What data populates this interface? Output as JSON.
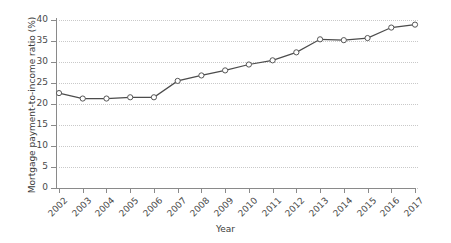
{
  "chart_data": {
    "type": "line",
    "title": "",
    "xlabel": "Year",
    "ylabel": "Mortgage payment-to-income ratio (%)",
    "categories": [
      "2002",
      "2003",
      "2004",
      "2005",
      "2006",
      "2007",
      "2008",
      "2009",
      "2010",
      "2011",
      "2012",
      "2013",
      "2014",
      "2015",
      "2016",
      "2017"
    ],
    "x": [
      2002,
      2003,
      2004,
      2005,
      2006,
      2007,
      2008,
      2009,
      2010,
      2011,
      2012,
      2013,
      2014,
      2015,
      2016,
      2017
    ],
    "values": [
      22.6,
      21.3,
      21.3,
      21.6,
      21.6,
      25.5,
      26.8,
      28.0,
      29.4,
      30.4,
      32.3,
      35.4,
      35.2,
      35.7,
      38.2,
      38.9
    ],
    "series": [
      {
        "name": "Mortgage payment-to-income ratio",
        "values": [
          22.6,
          21.3,
          21.3,
          21.6,
          21.6,
          25.5,
          26.8,
          28.0,
          29.4,
          30.4,
          32.3,
          35.4,
          35.2,
          35.7,
          38.2,
          38.9
        ]
      }
    ],
    "ylim": [
      0,
      40
    ],
    "yticks": [
      0,
      5,
      10,
      15,
      20,
      25,
      30,
      35,
      40
    ],
    "ytick_labels": [
      "0",
      "5",
      "10",
      "15",
      "20",
      "25",
      "30",
      "35",
      "40"
    ],
    "xlim": [
      2002,
      2017
    ],
    "grid": true,
    "grid_axis": "y",
    "grid_style": "dotted",
    "legend": null,
    "marker": "open-circle",
    "line_color": "#4c4c4c",
    "marker_fill": "#ffffff",
    "marker_stroke": "#555555",
    "grid_color": "#c9c9c9",
    "axis_color": "#8a8a8a",
    "background": "#ffffff"
  }
}
